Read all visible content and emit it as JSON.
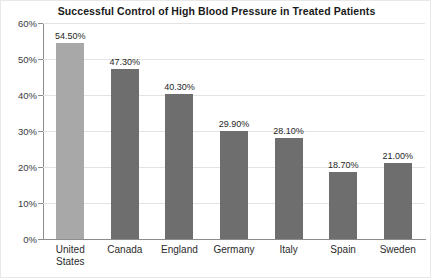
{
  "chart_data": {
    "type": "bar",
    "title": "Successful Control of High Blood Pressure in Treated Patients",
    "xlabel": "",
    "ylabel": "",
    "categories": [
      "United States",
      "Canada",
      "England",
      "Germany",
      "Italy",
      "Spain",
      "Sweden"
    ],
    "values": [
      54.5,
      47.3,
      40.3,
      29.9,
      28.1,
      18.7,
      21.0
    ],
    "value_labels": [
      "54.50%",
      "47.30%",
      "40.30%",
      "29.90%",
      "28.10%",
      "18.70%",
      "21.00%"
    ],
    "ylim": [
      0,
      60
    ],
    "ytick_labels": [
      "0%",
      "10%",
      "20%",
      "30%",
      "40%",
      "50%",
      "60%"
    ],
    "ytick_values": [
      0,
      10,
      20,
      30,
      40,
      50,
      60
    ],
    "grid": true,
    "legend": false,
    "bar_colors": [
      "#a8a8a8",
      "#6e6e6e",
      "#6e6e6e",
      "#6e6e6e",
      "#6e6e6e",
      "#6e6e6e",
      "#6e6e6e"
    ],
    "axis_color": "#8c8c8c",
    "gridline_color": "#e3e3e3",
    "text_color": "#262626",
    "background": "#ffffff"
  }
}
